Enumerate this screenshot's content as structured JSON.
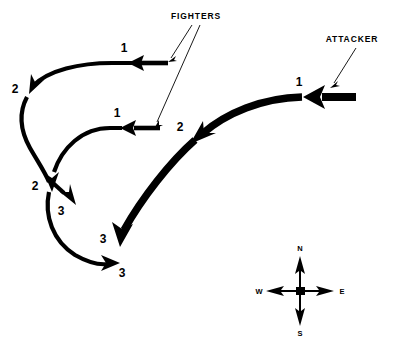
{
  "diagram": {
    "background_color": "#ffffff",
    "ink_color": "#000000",
    "width": 416,
    "height": 340,
    "annotations": [
      {
        "id": "fighters",
        "label": "FIGHTERS",
        "label_x": 196,
        "label_y": 18,
        "leader_lines": [
          {
            "x1": 194,
            "y1": 24,
            "x2": 170,
            "y2": 58
          },
          {
            "x1": 199,
            "y1": 24,
            "x2": 155,
            "y2": 124
          }
        ]
      },
      {
        "id": "attacker",
        "label": "ATTACKER",
        "label_x": 352,
        "label_y": 41,
        "leader_lines": [
          {
            "x1": 355,
            "y1": 47,
            "x2": 332,
            "y2": 84
          }
        ]
      }
    ],
    "tracks": [
      {
        "id": "fighter-north",
        "name": "fighter-north-track",
        "style": "thin",
        "tail_bar": {
          "x1": 168,
          "y1": 63,
          "x2": 141,
          "y2": 63
        },
        "path": "M 133 63 L 112 63 C 80 63 48 70 33 86",
        "waypoints": [
          {
            "label": "1",
            "x": 124,
            "y": 52,
            "head_x": 130,
            "head_y": 63,
            "angle": 180
          },
          {
            "label": "2",
            "x": 15,
            "y": 92,
            "head_x": 31,
            "head_y": 89,
            "angle": 133
          }
        ],
        "segment_after": "M 26 96 C 19 110 20 128 30 146 C 38 160 44 170 48 181"
      },
      {
        "id": "fighter-south",
        "name": "fighter-south-track",
        "style": "thin",
        "tail_bar": {
          "x1": 160,
          "y1": 128,
          "x2": 134,
          "y2": 128
        },
        "path": "M 127 128 L 110 128 C 82 128 62 146 54 170",
        "waypoints": [
          {
            "label": "1",
            "x": 117,
            "y": 117,
            "head_x": 124,
            "head_y": 128,
            "angle": 180
          },
          {
            "label": "2",
            "x": 35,
            "y": 188,
            "head_x": 51,
            "head_y": 184,
            "angle": 105
          },
          {
            "label": "3",
            "x": 59,
            "y": 210,
            "head_x": 73,
            "head_y": 200,
            "angle": 48
          }
        ],
        "branch": "M 53 182 L 66 194"
      },
      {
        "id": "fighter-continuation",
        "name": "fighter-continuation-track",
        "style": "thin",
        "path": "M 48 190 C 44 214 52 240 74 255 C 88 264 100 265 110 264",
        "waypoints": [
          {
            "label": "3",
            "x": 120,
            "y": 276,
            "head_x": 116,
            "head_y": 263,
            "angle": 0
          }
        ]
      },
      {
        "id": "attacker-track",
        "name": "attacker-track",
        "style": "thick",
        "tail_bar": {
          "x1": 355,
          "y1": 97,
          "x2": 322,
          "y2": 97
        },
        "path": "M 305 97 C 265 97 225 112 200 135",
        "waypoints": [
          {
            "label": "1",
            "x": 299,
            "y": 86,
            "head_x": 307,
            "head_y": 97,
            "angle": 180
          },
          {
            "label": "2",
            "x": 180,
            "y": 130,
            "head_x": 197,
            "head_y": 138,
            "angle": 138
          },
          {
            "label": "3",
            "x": 102,
            "y": 241,
            "head_x": 120,
            "head_y": 243,
            "angle": 72
          }
        ],
        "segment_after": "M 192 142 C 168 163 140 198 123 232"
      }
    ],
    "compass": {
      "name": "compass-rose",
      "center_x": 300,
      "center_y": 290,
      "arm_length": 34,
      "labels": {
        "north": "N",
        "east": "E",
        "south": "S",
        "west": "W"
      },
      "label_positions": {
        "north": {
          "x": 300,
          "y": 249
        },
        "east": {
          "x": 341,
          "y": 293
        },
        "south": {
          "x": 300,
          "y": 333
        },
        "west": {
          "x": 260,
          "y": 293
        }
      }
    }
  }
}
